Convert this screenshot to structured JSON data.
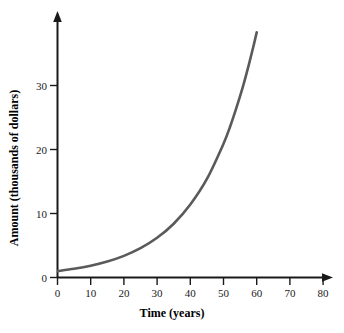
{
  "chart_data": {
    "type": "line",
    "title": "",
    "subtitle": "",
    "xlabel": "Time (years)",
    "ylabel": "Amount (thousands of dollars)",
    "xlim": [
      0,
      85
    ],
    "ylim": [
      0,
      38
    ],
    "xticks": [
      0,
      10,
      20,
      30,
      40,
      50,
      60,
      70,
      80
    ],
    "xtick_labels": [
      "0",
      "10",
      "20",
      "30",
      "40",
      "50",
      "60",
      "70",
      "80"
    ],
    "yticks": [
      0,
      10,
      20,
      30
    ],
    "ytick_labels": [
      "0",
      "10",
      "20",
      "30"
    ],
    "grid": false,
    "legend": null,
    "annotations": [],
    "axis_arrows": {
      "x": "right",
      "y": "up"
    },
    "series": [
      {
        "name": "Amount",
        "color": "#5a5a5a",
        "line_width": 2.6,
        "description": "exponential growth curve starting near 1 at t=0 and rising off the top of the plot near t=60",
        "x": [
          0,
          5,
          10,
          15,
          20,
          25,
          30,
          35,
          40,
          45,
          50,
          52,
          54,
          56,
          58,
          59,
          60
        ],
        "values": [
          1.0,
          1.36,
          1.84,
          2.49,
          3.38,
          4.58,
          6.2,
          8.4,
          11.4,
          15.4,
          20.9,
          23.6,
          26.7,
          30.1,
          34.0,
          36.1,
          38.3
        ]
      }
    ]
  },
  "axis_titles": {
    "x": "Time (years)",
    "y": "Amount (thousands of dollars)"
  },
  "colors": {
    "curve": "#5a5a5a",
    "axis": "#1a1a1a",
    "background": "#ffffff",
    "text": "#000000"
  }
}
